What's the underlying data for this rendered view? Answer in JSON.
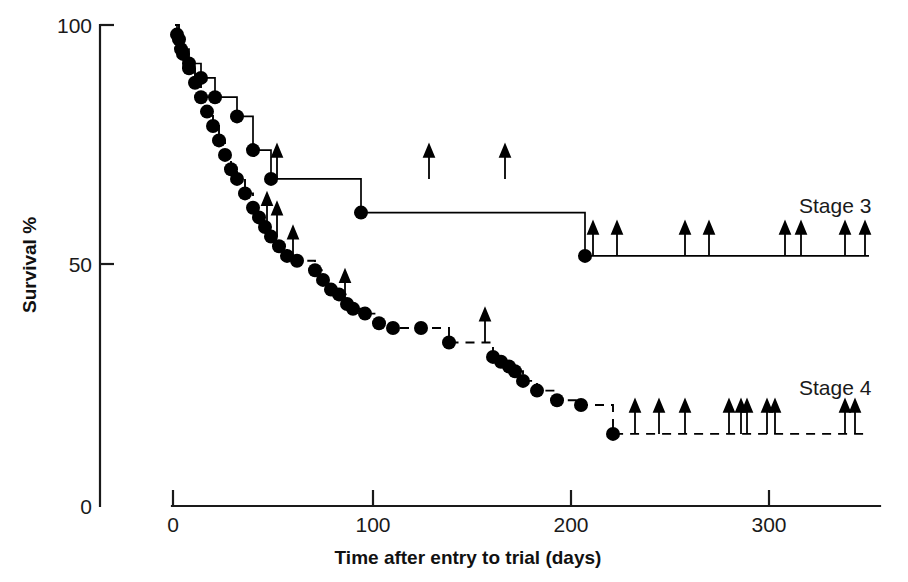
{
  "chart_data": {
    "type": "line",
    "title": "",
    "subtitle": "",
    "xlabel": "Time after entry to trial (days)",
    "ylabel": "Survival %",
    "xlim": [
      0,
      350
    ],
    "ylim": [
      0,
      100
    ],
    "xticks": [
      0,
      100,
      200,
      300
    ],
    "xticklabels": [
      "0",
      "100",
      "200",
      "300"
    ],
    "yticks": [
      0,
      50,
      100
    ],
    "yticklabels": [
      "0",
      "50",
      "100"
    ],
    "grid": false,
    "legend_position": "inline-right",
    "plot_note": "Kaplan-Meier survival curves with event dots and censoring arrows",
    "series": [
      {
        "name": "Stage 3",
        "label": "Stage 3",
        "linestyle": "solid",
        "color": "#000000",
        "label_x": 313,
        "label_y": 61,
        "steps": [
          [
            1,
            100
          ],
          [
            2,
            98
          ],
          [
            4,
            95
          ],
          [
            6,
            95
          ],
          [
            8,
            92
          ],
          [
            12,
            92
          ],
          [
            14,
            89
          ],
          [
            19,
            89
          ],
          [
            21,
            85
          ],
          [
            30,
            85
          ],
          [
            32,
            81
          ],
          [
            38,
            81
          ],
          [
            40,
            74
          ],
          [
            47,
            74
          ],
          [
            49,
            68
          ],
          [
            92,
            68
          ],
          [
            94,
            61
          ],
          [
            204,
            61
          ],
          [
            206,
            52
          ],
          [
            253,
            52
          ],
          [
            255,
            52
          ],
          [
            348,
            52
          ]
        ],
        "event_dots": [
          [
            2,
            98
          ],
          [
            4,
            95
          ],
          [
            8,
            92
          ],
          [
            14,
            89
          ],
          [
            21,
            85
          ],
          [
            32,
            81
          ],
          [
            40,
            74
          ],
          [
            49,
            68
          ],
          [
            94,
            61
          ],
          [
            206,
            52
          ]
        ],
        "censor_arrows": [
          [
            52,
            68
          ],
          [
            128,
            68
          ],
          [
            166,
            68
          ],
          [
            210,
            52
          ],
          [
            222,
            52
          ],
          [
            256,
            52
          ],
          [
            268,
            52
          ],
          [
            306,
            52
          ],
          [
            314,
            52
          ],
          [
            336,
            52
          ],
          [
            346,
            52
          ]
        ]
      },
      {
        "name": "Stage 4",
        "label": "Stage 4",
        "linestyle": "dashed",
        "color": "#000000",
        "label_x": 313,
        "label_y": 23,
        "steps": [
          [
            1,
            100
          ],
          [
            3,
            97
          ],
          [
            5,
            94
          ],
          [
            8,
            91
          ],
          [
            11,
            88
          ],
          [
            14,
            85
          ],
          [
            17,
            82
          ],
          [
            20,
            79
          ],
          [
            23,
            76
          ],
          [
            26,
            73
          ],
          [
            29,
            70
          ],
          [
            32,
            68
          ],
          [
            36,
            65
          ],
          [
            40,
            62
          ],
          [
            43,
            60
          ],
          [
            46,
            58
          ],
          [
            49,
            56
          ],
          [
            53,
            54
          ],
          [
            57,
            52
          ],
          [
            62,
            51
          ],
          [
            68,
            51
          ],
          [
            71,
            49
          ],
          [
            75,
            47
          ],
          [
            79,
            45
          ],
          [
            83,
            44
          ],
          [
            87,
            42
          ],
          [
            90,
            41
          ],
          [
            96,
            40
          ],
          [
            103,
            38
          ],
          [
            110,
            37
          ],
          [
            124,
            37
          ],
          [
            138,
            34
          ],
          [
            156,
            34
          ],
          [
            160,
            31
          ],
          [
            164,
            30
          ],
          [
            168,
            29
          ],
          [
            171,
            28
          ],
          [
            175,
            26
          ],
          [
            182,
            24
          ],
          [
            192,
            22
          ],
          [
            204,
            21
          ],
          [
            218,
            21
          ],
          [
            220,
            15
          ],
          [
            348,
            15
          ]
        ],
        "event_dots": [
          [
            3,
            97
          ],
          [
            5,
            94
          ],
          [
            8,
            91
          ],
          [
            11,
            88
          ],
          [
            14,
            85
          ],
          [
            17,
            82
          ],
          [
            20,
            79
          ],
          [
            23,
            76
          ],
          [
            26,
            73
          ],
          [
            29,
            70
          ],
          [
            32,
            68
          ],
          [
            36,
            65
          ],
          [
            40,
            62
          ],
          [
            43,
            60
          ],
          [
            46,
            58
          ],
          [
            49,
            56
          ],
          [
            53,
            54
          ],
          [
            57,
            52
          ],
          [
            62,
            51
          ],
          [
            71,
            49
          ],
          [
            75,
            47
          ],
          [
            79,
            45
          ],
          [
            83,
            44
          ],
          [
            87,
            42
          ],
          [
            90,
            41
          ],
          [
            96,
            40
          ],
          [
            103,
            38
          ],
          [
            110,
            37
          ],
          [
            124,
            37
          ],
          [
            138,
            34
          ],
          [
            160,
            31
          ],
          [
            164,
            30
          ],
          [
            168,
            29
          ],
          [
            171,
            28
          ],
          [
            175,
            26
          ],
          [
            182,
            24
          ],
          [
            192,
            22
          ],
          [
            204,
            21
          ],
          [
            220,
            15
          ]
        ],
        "censor_arrows": [
          [
            47,
            58
          ],
          [
            52,
            56
          ],
          [
            60,
            51
          ],
          [
            86,
            42
          ],
          [
            156,
            34
          ],
          [
            231,
            15
          ],
          [
            243,
            15
          ],
          [
            256,
            15
          ],
          [
            278,
            15
          ],
          [
            284,
            15
          ],
          [
            287,
            15
          ],
          [
            297,
            15
          ],
          [
            301,
            15
          ],
          [
            336,
            15
          ],
          [
            341,
            15
          ]
        ]
      }
    ]
  },
  "axes": {
    "y_axis_title": "Survival %",
    "x_axis_title": "Time after entry to trial (days)",
    "y_tick_labels": [
      "100",
      "50",
      "0"
    ],
    "x_tick_labels": [
      "0",
      "100",
      "200",
      "300"
    ]
  },
  "colors": {
    "ink": "#1a1a1a",
    "curve": "#000000",
    "background": "#ffffff"
  }
}
